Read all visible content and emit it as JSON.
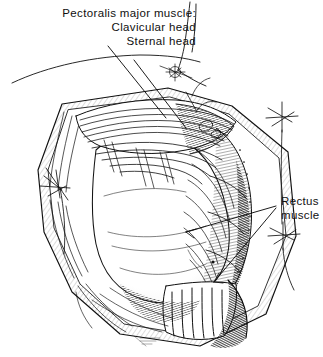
{
  "figure": {
    "kind": "medical-line-illustration",
    "width": 323,
    "height": 357,
    "ink_color": "#101010",
    "background_color": "#ffffff"
  },
  "labels": {
    "pectoralis": {
      "line1": "Pectoralis major muscle:",
      "line2": "Clavicular head",
      "line3": "Sternal head"
    },
    "rectus": {
      "line1": "Rectus",
      "line2": "muscle"
    }
  },
  "annotations": {
    "signature": ""
  }
}
